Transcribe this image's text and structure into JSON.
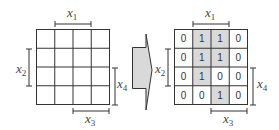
{
  "left_grid": {
    "rows": 4,
    "cols": 4,
    "labels": {
      "x1": "x",
      "x1_sub": "1",
      "x2": "x",
      "x2_sub": "2",
      "x3": "x",
      "x3_sub": "3",
      "x4": "x",
      "x4_sub": "4"
    }
  },
  "arrow": {
    "direction": "right",
    "fill": "#d9d9d9"
  },
  "right_grid": {
    "values": [
      [
        "0",
        "1",
        "1",
        "0"
      ],
      [
        "0",
        "1",
        "1",
        "0"
      ],
      [
        "0",
        "1",
        "0",
        "0"
      ],
      [
        "0",
        "0",
        "1",
        "0"
      ]
    ],
    "highlight_color": "#d9d9d9",
    "labels": {
      "x1": "x",
      "x1_sub": "1",
      "x2": "x",
      "x2_sub": "2",
      "x3": "x",
      "x3_sub": "3",
      "x4": "x",
      "x4_sub": "4"
    }
  }
}
